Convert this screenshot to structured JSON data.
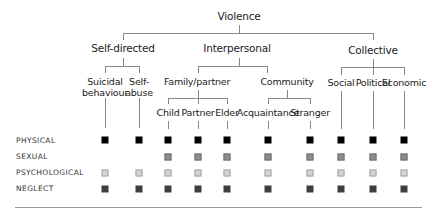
{
  "title": "Violence",
  "categories": [
    {
      "label": "Self-directed",
      "subtypes": [
        "Suicidal behaviour",
        "Self-abuse"
      ]
    },
    {
      "label": "Interpersonal",
      "groups": [
        {
          "label": "Family/partner",
          "subtypes": [
            "Child",
            "Partner",
            "Elder"
          ]
        },
        {
          "label": "Community",
          "subtypes": [
            "Acquaintance",
            "Stranger"
          ]
        }
      ]
    },
    {
      "label": "Collective",
      "subtypes": [
        "Social",
        "Political",
        "Economic"
      ]
    }
  ],
  "labels": {
    "root": "Violence",
    "self_directed": "Self-directed",
    "interpersonal": "Interpersonal",
    "collective": "Collective",
    "family_partner": "Family/partner",
    "community": "Community",
    "suicidal_1": "Suicidal",
    "suicidal_2": "behaviour",
    "self_abuse_1": "Self-",
    "self_abuse_2": "abuse",
    "child": "Child",
    "partner": "Partner",
    "elder": "Elder",
    "acquaintance": "Acquaintance",
    "stranger": "Stranger",
    "social": "Social",
    "political": "Political",
    "economic": "Economic"
  },
  "rows": {
    "physical": "PHYSICAL",
    "sexual": "SEXUAL",
    "psychological": "PSYCHOLOGICAL",
    "neglect": "NEGLECT"
  },
  "matrix": {
    "columns": [
      "Suicidal behaviour",
      "Self-abuse",
      "Child",
      "Partner",
      "Elder",
      "Acquaintance",
      "Stranger",
      "Social",
      "Political",
      "Economic"
    ],
    "PHYSICAL": [
      1,
      1,
      1,
      1,
      1,
      1,
      1,
      1,
      1,
      1
    ],
    "SEXUAL": [
      0,
      0,
      1,
      1,
      1,
      1,
      1,
      1,
      1,
      1
    ],
    "PSYCHOLOGICAL": [
      1,
      1,
      1,
      1,
      1,
      1,
      1,
      1,
      1,
      1
    ],
    "NEGLECT": [
      1,
      1,
      1,
      1,
      1,
      1,
      1,
      1,
      1,
      1
    ]
  },
  "colors": {
    "physical": "#000000",
    "sexual": "#8d8d8d",
    "psychological": "#d4d4d4",
    "neglect": "#3e3e3e",
    "lines": "#888888"
  }
}
